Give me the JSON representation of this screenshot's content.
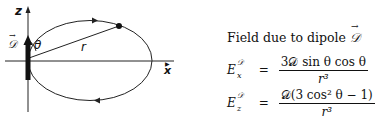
{
  "diagram": {
    "axis_z_label": "z",
    "axis_x_label": "x",
    "dipole_label": "𝒟",
    "angle_label": "θ",
    "radius_label": "r"
  },
  "caption": {
    "title": "Field due to dipole",
    "title_symbol": "𝒟"
  },
  "equations": [
    {
      "lhs_base": "E",
      "lhs_sup": "𝒟",
      "lhs_sub": "x",
      "equals": "=",
      "numerator": "3𝒟 sin θ cos θ",
      "denominator": "r³"
    },
    {
      "lhs_base": "E",
      "lhs_sup": "𝒟",
      "lhs_sub": "z",
      "equals": "=",
      "numerator": "𝒟(3 cos² θ − 1)",
      "denominator": "r³"
    }
  ]
}
